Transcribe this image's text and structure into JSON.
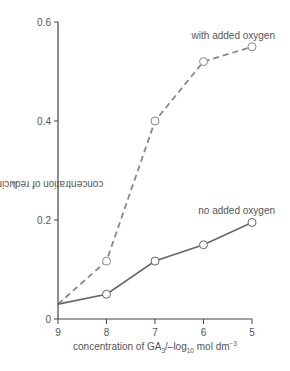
{
  "chart_data": {
    "type": "line",
    "title": "",
    "xlabel": "concentration of GA3/-log10 mol dm-3",
    "ylabel": "concentration of reducing sugar/mg cm-3",
    "x": [
      9,
      8,
      7,
      6,
      5
    ],
    "x_ticks": [
      "9",
      "8",
      "7",
      "6",
      "5"
    ],
    "y_ticks": [
      "0",
      "0.2",
      "0.4",
      "0.6"
    ],
    "ylim": [
      0,
      0.6
    ],
    "xlim": [
      9,
      5
    ],
    "x_reversed": true,
    "grid": false,
    "legend": "inline labels near line ends",
    "series": [
      {
        "name": "with added oxygen",
        "style": "dashed",
        "values": [
          0.03,
          0.117,
          0.4,
          0.52,
          0.55
        ]
      },
      {
        "name": "no added oxygen",
        "style": "solid",
        "values": [
          0.03,
          0.05,
          0.117,
          0.15,
          0.195
        ]
      }
    ]
  },
  "labels": {
    "xlabel_main": "concentration of GA",
    "xlabel_sub3": "3",
    "xlabel_mid": "/–log",
    "xlabel_sub10": "10",
    "xlabel_unit": " mol dm",
    "xlabel_sup": "−3",
    "ylabel_main": "concentration of reducing sugar/mg cm",
    "ylabel_sup": "−3"
  },
  "colors": {
    "axis": "#444444",
    "line": "#666666",
    "dashed": "#888888",
    "text": "#555555"
  }
}
